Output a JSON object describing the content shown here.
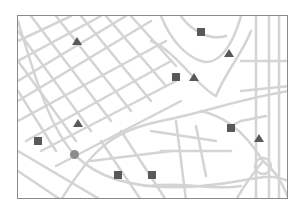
{
  "map": {
    "colors": {
      "road": "#d4d4d4",
      "background": "#ffffff",
      "frame": "#8a8a8a",
      "marker_dark": "#595959",
      "marker_circle": "#8c8c8c"
    },
    "markers": [
      {
        "type": "triangle",
        "x": 77,
        "y": 41
      },
      {
        "type": "square",
        "x": 201,
        "y": 32
      },
      {
        "type": "triangle",
        "x": 229,
        "y": 53
      },
      {
        "type": "square",
        "x": 176,
        "y": 77
      },
      {
        "type": "triangle",
        "x": 194,
        "y": 77
      },
      {
        "type": "triangle",
        "x": 78,
        "y": 123
      },
      {
        "type": "square",
        "x": 38,
        "y": 141
      },
      {
        "type": "circle",
        "x": 74,
        "y": 154
      },
      {
        "type": "square",
        "x": 118,
        "y": 175
      },
      {
        "type": "square",
        "x": 152,
        "y": 175
      },
      {
        "type": "square",
        "x": 231,
        "y": 128
      },
      {
        "type": "triangle",
        "x": 259,
        "y": 138
      }
    ]
  }
}
